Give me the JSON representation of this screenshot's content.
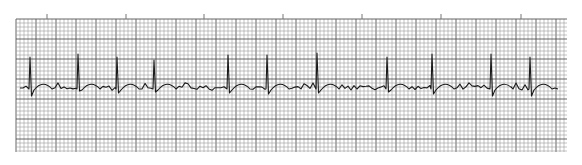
{
  "chart_data": {
    "type": "line",
    "title": "",
    "subtitle": "",
    "xlabel": "",
    "ylabel": "",
    "grid": true,
    "legend": null,
    "grid_box": {
      "x0": 16,
      "y0": 19,
      "x1": 567,
      "y1": 152
    },
    "small_box_px": 4,
    "large_box_every": 5,
    "time_marks_x": [
      47,
      126,
      204,
      283,
      362,
      441,
      521
    ],
    "baseline_y": 88,
    "r_peaks": [
      {
        "x": 30,
        "top_y": 57,
        "s_y": 96
      },
      {
        "x": 78,
        "top_y": 54,
        "s_y": 91
      },
      {
        "x": 117,
        "top_y": 57,
        "s_y": 93
      },
      {
        "x": 154,
        "top_y": 60,
        "s_y": 92
      },
      {
        "x": 228,
        "top_y": 55,
        "s_y": 93
      },
      {
        "x": 267,
        "top_y": 55,
        "s_y": 94
      },
      {
        "x": 317,
        "top_y": 53,
        "s_y": 93
      },
      {
        "x": 387,
        "top_y": 57,
        "s_y": 92
      },
      {
        "x": 432,
        "top_y": 54,
        "s_y": 94
      },
      {
        "x": 491,
        "top_y": 54,
        "s_y": 96
      },
      {
        "x": 530,
        "top_y": 57,
        "s_y": 96
      }
    ],
    "rhythm": "irregular",
    "beat_count": 11,
    "colors": {
      "trace": "#1a1a1a",
      "grid_minor": "#9a9a9a",
      "grid_major": "#555555",
      "paper": "#ffffff"
    }
  }
}
